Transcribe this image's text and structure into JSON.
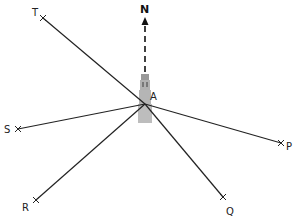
{
  "diagram": {
    "type": "bearing-diagram",
    "north_label": "N",
    "center": {
      "label": "A",
      "x": 145,
      "y": 104
    },
    "landmark": "lighthouse-tower",
    "points": [
      {
        "label": "T",
        "x": 43,
        "y": 18
      },
      {
        "label": "S",
        "x": 18,
        "y": 129
      },
      {
        "label": "R",
        "x": 36,
        "y": 200
      },
      {
        "label": "Q",
        "x": 223,
        "y": 197
      },
      {
        "label": "P",
        "x": 281,
        "y": 143
      }
    ],
    "colors": {
      "line": "#222222",
      "tower_fill": "#b5b5b5",
      "tower_dark": "#8a8a8a"
    }
  }
}
